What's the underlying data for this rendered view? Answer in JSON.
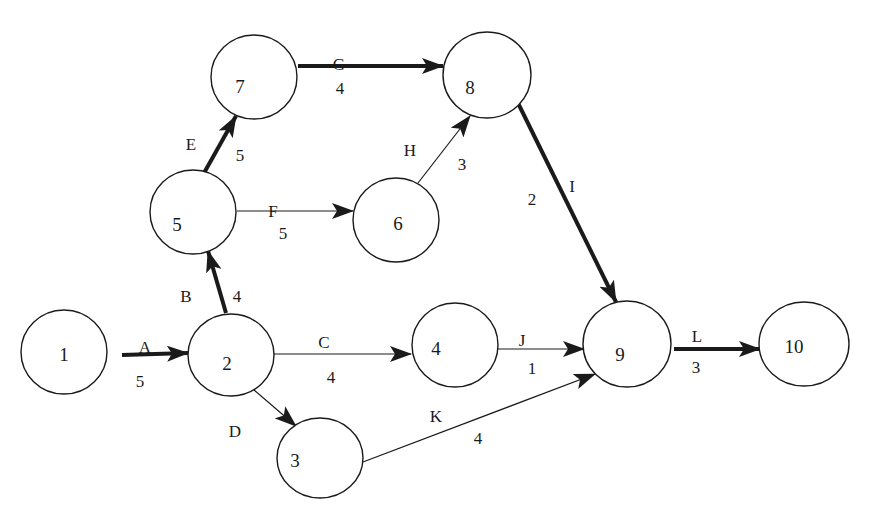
{
  "diagram": {
    "type": "activity-on-arrow network",
    "nodes": [
      {
        "id": "1",
        "label": "1",
        "cx": 64,
        "cy": 352,
        "r": 43
      },
      {
        "id": "2",
        "label": "2",
        "cx": 231,
        "cy": 355,
        "r": 43
      },
      {
        "id": "3",
        "label": "3",
        "cx": 320,
        "cy": 458,
        "r": 43
      },
      {
        "id": "4",
        "label": "4",
        "cx": 455,
        "cy": 345,
        "r": 43
      },
      {
        "id": "5",
        "label": "5",
        "cx": 193,
        "cy": 212,
        "r": 43
      },
      {
        "id": "6",
        "label": "6",
        "cx": 396,
        "cy": 220,
        "r": 43
      },
      {
        "id": "7",
        "label": "7",
        "cx": 254,
        "cy": 77,
        "r": 43
      },
      {
        "id": "8",
        "label": "8",
        "cx": 487,
        "cy": 75,
        "r": 43
      },
      {
        "id": "9",
        "label": "9",
        "cx": 627,
        "cy": 354,
        "r": 43
      },
      {
        "id": "10",
        "label": "10",
        "cx": 803,
        "cy": 346,
        "r": 43
      }
    ],
    "edges": [
      {
        "activity": "A",
        "duration": "5",
        "from": "1",
        "to": "2",
        "critical": true
      },
      {
        "activity": "B",
        "duration": "4",
        "from": "2",
        "to": "5",
        "critical": true
      },
      {
        "activity": "C",
        "duration": "4",
        "from": "2",
        "to": "4",
        "critical": false
      },
      {
        "activity": "D",
        "duration": "",
        "from": "2",
        "to": "3",
        "critical": false
      },
      {
        "activity": "E",
        "duration": "5",
        "from": "5",
        "to": "7",
        "critical": true
      },
      {
        "activity": "F",
        "duration": "5",
        "from": "5",
        "to": "6",
        "critical": false
      },
      {
        "activity": "G",
        "duration": "4",
        "from": "7",
        "to": "8",
        "critical": true
      },
      {
        "activity": "H",
        "duration": "3",
        "from": "6",
        "to": "8",
        "critical": false
      },
      {
        "activity": "I",
        "duration": "2",
        "from": "8",
        "to": "9",
        "critical": true
      },
      {
        "activity": "J",
        "duration": "1",
        "from": "4",
        "to": "9",
        "critical": false
      },
      {
        "activity": "K",
        "duration": "4",
        "from": "3",
        "to": "9",
        "critical": false
      },
      {
        "activity": "L",
        "duration": "3",
        "from": "9",
        "to": "10",
        "critical": true
      }
    ],
    "labels": {
      "A": {
        "name": "A",
        "nx": 145,
        "ny": 347,
        "duration": "5",
        "dx": 140,
        "dy": 379
      },
      "B": {
        "name": "B",
        "nx": 186,
        "ny": 296,
        "duration": "4",
        "dx": 237,
        "dy": 296
      },
      "C": {
        "name": "C",
        "nx": 324,
        "ny": 342,
        "duration": "4",
        "dx": 331,
        "dy": 376
      },
      "D": {
        "name": "D",
        "nx": 235,
        "ny": 431,
        "duration": "",
        "dx": 0,
        "dy": 0
      },
      "E": {
        "name": "E",
        "nx": 191,
        "ny": 144,
        "duration": "5",
        "dx": 240,
        "dy": 154
      },
      "F": {
        "name": "F",
        "nx": 273,
        "ny": 211,
        "duration": "5",
        "dx": 283,
        "dy": 233
      },
      "G": {
        "name": "G",
        "nx": 339,
        "ny": 64,
        "duration": "4",
        "dx": 340,
        "dy": 88
      },
      "H": {
        "name": "H",
        "nx": 410,
        "ny": 150,
        "duration": "3",
        "dx": 462,
        "dy": 164
      },
      "I": {
        "name": "I",
        "nx": 572,
        "ny": 186,
        "duration": "2",
        "dx": 532,
        "dy": 199
      },
      "J": {
        "name": "J",
        "nx": 522,
        "ny": 340,
        "duration": "1",
        "dx": 532,
        "dy": 368
      },
      "K": {
        "name": "K",
        "nx": 436,
        "ny": 416,
        "duration": "4",
        "dx": 478,
        "dy": 437
      },
      "L": {
        "name": "L",
        "nx": 697,
        "ny": 335,
        "duration": "3",
        "dx": 696,
        "dy": 366
      }
    }
  },
  "colors": {
    "line": "#1a1a1a",
    "background": "#ffffff"
  }
}
